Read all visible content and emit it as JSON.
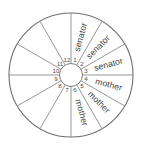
{
  "figure": {
    "name": "labeled-wheel-diagram",
    "type": "radial-wheel",
    "sector_count": 12,
    "background_color": "#ffffff",
    "line_color": "#8a8a8a",
    "rim_color": "#6e6e6e",
    "text_color": "#3d3d3d"
  },
  "geometry": {
    "center_x": 71,
    "center_y": 75,
    "outer_radius": 62,
    "hub_radius": 11.5,
    "number_radius": 15.5,
    "label_radius": 39
  },
  "sectors": [
    {
      "number": "1",
      "label": "senator",
      "start_deg": 0,
      "end_deg": 30
    },
    {
      "number": "2",
      "label": "senator",
      "start_deg": 30,
      "end_deg": 60
    },
    {
      "number": "3",
      "label": "senator",
      "start_deg": 60,
      "end_deg": 90
    },
    {
      "number": "4",
      "label": "mother",
      "start_deg": 90,
      "end_deg": 120
    },
    {
      "number": "5",
      "label": "mother",
      "start_deg": 120,
      "end_deg": 150
    },
    {
      "number": "6",
      "label": "mother",
      "start_deg": 150,
      "end_deg": 180
    },
    {
      "number": "7",
      "label": "",
      "start_deg": 180,
      "end_deg": 210
    },
    {
      "number": "8",
      "label": "",
      "start_deg": 210,
      "end_deg": 240
    },
    {
      "number": "9",
      "label": "",
      "start_deg": 240,
      "end_deg": 270
    },
    {
      "number": "10",
      "label": "",
      "start_deg": 270,
      "end_deg": 300
    },
    {
      "number": "11",
      "label": "",
      "start_deg": 300,
      "end_deg": 330
    },
    {
      "number": "12",
      "label": "",
      "start_deg": 330,
      "end_deg": 360
    }
  ]
}
